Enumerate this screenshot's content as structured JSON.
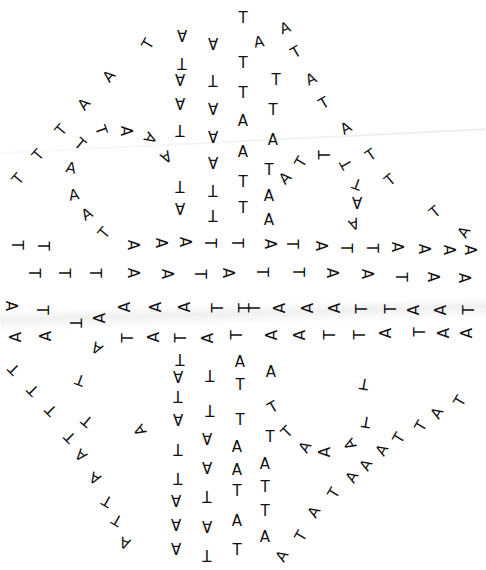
{
  "diagram": {
    "type": "nucleic-acid secondary structure",
    "alphabet": [
      "A",
      "T"
    ],
    "text_color": "#111111",
    "background": "#ffffff",
    "nucleotides": [
      {
        "c": "T",
        "x": 243,
        "y": 18,
        "r": 0
      },
      {
        "c": "A",
        "x": 259,
        "y": 42,
        "r": -10
      },
      {
        "c": "A",
        "x": 285,
        "y": 28,
        "r": -20
      },
      {
        "c": "T",
        "x": 296,
        "y": 52,
        "r": -30
      },
      {
        "c": "A",
        "x": 311,
        "y": 79,
        "r": -25
      },
      {
        "c": "T",
        "x": 324,
        "y": 103,
        "r": -30
      },
      {
        "c": "A",
        "x": 346,
        "y": 128,
        "r": -30
      },
      {
        "c": "T",
        "x": 371,
        "y": 155,
        "r": -35
      },
      {
        "c": "T",
        "x": 390,
        "y": 180,
        "r": -40
      },
      {
        "c": "T",
        "x": 435,
        "y": 212,
        "r": -40
      },
      {
        "c": "A",
        "x": 464,
        "y": 232,
        "r": -60
      },
      {
        "c": "A",
        "x": 182,
        "y": 35,
        "r": 180
      },
      {
        "c": "A",
        "x": 213,
        "y": 43,
        "r": 180
      },
      {
        "c": "T",
        "x": 243,
        "y": 63,
        "r": 0
      },
      {
        "c": "T",
        "x": 276,
        "y": 80,
        "r": 0
      },
      {
        "c": "T",
        "x": 182,
        "y": 63,
        "r": 180
      },
      {
        "c": "T",
        "x": 213,
        "y": 80,
        "r": 180
      },
      {
        "c": "A",
        "x": 180,
        "y": 79,
        "r": 180
      },
      {
        "c": "A",
        "x": 180,
        "y": 103,
        "r": 180
      },
      {
        "c": "A",
        "x": 213,
        "y": 108,
        "r": 180
      },
      {
        "c": "T",
        "x": 243,
        "y": 93,
        "r": 0
      },
      {
        "c": "T",
        "x": 273,
        "y": 110,
        "r": 0
      },
      {
        "c": "A",
        "x": 243,
        "y": 121,
        "r": 0
      },
      {
        "c": "A",
        "x": 213,
        "y": 136,
        "r": 180
      },
      {
        "c": "T",
        "x": 180,
        "y": 130,
        "r": 180
      },
      {
        "c": "A",
        "x": 273,
        "y": 140,
        "r": 0
      },
      {
        "c": "A",
        "x": 243,
        "y": 152,
        "r": 0
      },
      {
        "c": "A",
        "x": 213,
        "y": 162,
        "r": 180
      },
      {
        "c": "T",
        "x": 269,
        "y": 170,
        "r": 0
      },
      {
        "c": "T",
        "x": 243,
        "y": 182,
        "r": 0
      },
      {
        "c": "T",
        "x": 213,
        "y": 190,
        "r": 180
      },
      {
        "c": "A",
        "x": 269,
        "y": 196,
        "r": 0
      },
      {
        "c": "T",
        "x": 243,
        "y": 208,
        "r": 0
      },
      {
        "c": "T",
        "x": 213,
        "y": 215,
        "r": 180
      },
      {
        "c": "A",
        "x": 269,
        "y": 220,
        "r": 0
      },
      {
        "c": "T",
        "x": 180,
        "y": 186,
        "r": 180
      },
      {
        "c": "A",
        "x": 180,
        "y": 208,
        "r": 180
      },
      {
        "c": "A",
        "x": 166,
        "y": 157,
        "r": 150
      },
      {
        "c": "A",
        "x": 150,
        "y": 138,
        "r": 120
      },
      {
        "c": "A",
        "x": 126,
        "y": 131,
        "r": 90
      },
      {
        "c": "T",
        "x": 101,
        "y": 130,
        "r": 70
      },
      {
        "c": "T",
        "x": 80,
        "y": 144,
        "r": 40
      },
      {
        "c": "A",
        "x": 71,
        "y": 168,
        "r": 10
      },
      {
        "c": "A",
        "x": 74,
        "y": 195,
        "r": -10
      },
      {
        "c": "A",
        "x": 87,
        "y": 214,
        "r": -30
      },
      {
        "c": "T",
        "x": 104,
        "y": 233,
        "r": -50
      },
      {
        "c": "T",
        "x": 148,
        "y": 44,
        "r": -60
      },
      {
        "c": "A",
        "x": 109,
        "y": 76,
        "r": -50
      },
      {
        "c": "A",
        "x": 84,
        "y": 104,
        "r": -50
      },
      {
        "c": "T",
        "x": 61,
        "y": 130,
        "r": -50
      },
      {
        "c": "T",
        "x": 38,
        "y": 155,
        "r": -50
      },
      {
        "c": "T",
        "x": 18,
        "y": 179,
        "r": -50
      },
      {
        "c": "A",
        "x": 285,
        "y": 178,
        "r": -45
      },
      {
        "c": "T",
        "x": 301,
        "y": 162,
        "r": -60
      },
      {
        "c": "T",
        "x": 325,
        "y": 155,
        "r": -90
      },
      {
        "c": "T",
        "x": 346,
        "y": 164,
        "r": -120
      },
      {
        "c": "T",
        "x": 357,
        "y": 184,
        "r": -160
      },
      {
        "c": "A",
        "x": 357,
        "y": 202,
        "r": 180
      },
      {
        "c": "A",
        "x": 354,
        "y": 224,
        "r": 160
      },
      {
        "c": "T",
        "x": 17,
        "y": 245,
        "r": 90
      },
      {
        "c": "T",
        "x": 43,
        "y": 246,
        "r": 90
      },
      {
        "c": "A",
        "x": 133,
        "y": 245,
        "r": 90
      },
      {
        "c": "A",
        "x": 161,
        "y": 243,
        "r": 90
      },
      {
        "c": "A",
        "x": 185,
        "y": 242,
        "r": 90
      },
      {
        "c": "T",
        "x": 210,
        "y": 243,
        "r": 90
      },
      {
        "c": "T",
        "x": 237,
        "y": 243,
        "r": 90
      },
      {
        "c": "A",
        "x": 270,
        "y": 244,
        "r": 90
      },
      {
        "c": "T",
        "x": 292,
        "y": 244,
        "r": 90
      },
      {
        "c": "A",
        "x": 321,
        "y": 246,
        "r": 90
      },
      {
        "c": "T",
        "x": 346,
        "y": 248,
        "r": 90
      },
      {
        "c": "T",
        "x": 372,
        "y": 248,
        "r": 90
      },
      {
        "c": "A",
        "x": 397,
        "y": 247,
        "r": 90
      },
      {
        "c": "A",
        "x": 424,
        "y": 249,
        "r": 90
      },
      {
        "c": "A",
        "x": 449,
        "y": 250,
        "r": 90
      },
      {
        "c": "A",
        "x": 470,
        "y": 250,
        "r": 90
      },
      {
        "c": "T",
        "x": 34,
        "y": 273,
        "r": 90
      },
      {
        "c": "T",
        "x": 64,
        "y": 273,
        "r": 90
      },
      {
        "c": "T",
        "x": 95,
        "y": 273,
        "r": 90
      },
      {
        "c": "A",
        "x": 133,
        "y": 273,
        "r": 90
      },
      {
        "c": "A",
        "x": 167,
        "y": 274,
        "r": 90
      },
      {
        "c": "T",
        "x": 200,
        "y": 274,
        "r": 90
      },
      {
        "c": "A",
        "x": 228,
        "y": 273,
        "r": 90
      },
      {
        "c": "T",
        "x": 262,
        "y": 272,
        "r": 90
      },
      {
        "c": "T",
        "x": 298,
        "y": 272,
        "r": 90
      },
      {
        "c": "A",
        "x": 332,
        "y": 273,
        "r": 90
      },
      {
        "c": "A",
        "x": 367,
        "y": 274,
        "r": 90
      },
      {
        "c": "T",
        "x": 401,
        "y": 277,
        "r": 90
      },
      {
        "c": "A",
        "x": 433,
        "y": 277,
        "r": 90
      },
      {
        "c": "A",
        "x": 464,
        "y": 278,
        "r": 90
      },
      {
        "c": "A",
        "x": 11,
        "y": 306,
        "r": 90
      },
      {
        "c": "T",
        "x": 42,
        "y": 310,
        "r": 90
      },
      {
        "c": "T",
        "x": 75,
        "y": 323,
        "r": 90
      },
      {
        "c": "A",
        "x": 100,
        "y": 318,
        "r": -90
      },
      {
        "c": "A",
        "x": 125,
        "y": 307,
        "r": -90
      },
      {
        "c": "A",
        "x": 156,
        "y": 307,
        "r": -90
      },
      {
        "c": "A",
        "x": 185,
        "y": 307,
        "r": -90
      },
      {
        "c": "T",
        "x": 218,
        "y": 308,
        "r": -90
      },
      {
        "c": "T",
        "x": 245,
        "y": 308,
        "r": -90
      },
      {
        "c": "T",
        "x": 255,
        "y": 308,
        "r": -90
      },
      {
        "c": "A",
        "x": 280,
        "y": 308,
        "r": -90
      },
      {
        "c": "A",
        "x": 308,
        "y": 308,
        "r": -90
      },
      {
        "c": "A",
        "x": 335,
        "y": 308,
        "r": -90
      },
      {
        "c": "T",
        "x": 362,
        "y": 309,
        "r": -90
      },
      {
        "c": "T",
        "x": 391,
        "y": 309,
        "r": -90
      },
      {
        "c": "A",
        "x": 414,
        "y": 310,
        "r": -90
      },
      {
        "c": "A",
        "x": 441,
        "y": 310,
        "r": -90
      },
      {
        "c": "T",
        "x": 469,
        "y": 310,
        "r": -90
      },
      {
        "c": "A",
        "x": 16,
        "y": 337,
        "r": -90
      },
      {
        "c": "A",
        "x": 46,
        "y": 336,
        "r": -90
      },
      {
        "c": "T",
        "x": 128,
        "y": 338,
        "r": -90
      },
      {
        "c": "A",
        "x": 154,
        "y": 337,
        "r": -90
      },
      {
        "c": "T",
        "x": 181,
        "y": 338,
        "r": -90
      },
      {
        "c": "A",
        "x": 208,
        "y": 338,
        "r": -90
      },
      {
        "c": "T",
        "x": 237,
        "y": 335,
        "r": -90
      },
      {
        "c": "A",
        "x": 272,
        "y": 335,
        "r": -90
      },
      {
        "c": "A",
        "x": 300,
        "y": 335,
        "r": -90
      },
      {
        "c": "T",
        "x": 330,
        "y": 335,
        "r": -90
      },
      {
        "c": "T",
        "x": 360,
        "y": 335,
        "r": -90
      },
      {
        "c": "A",
        "x": 386,
        "y": 333,
        "r": -90
      },
      {
        "c": "T",
        "x": 420,
        "y": 332,
        "r": -90
      },
      {
        "c": "A",
        "x": 444,
        "y": 333,
        "r": -90
      },
      {
        "c": "A",
        "x": 467,
        "y": 333,
        "r": -90
      },
      {
        "c": "A",
        "x": 97,
        "y": 348,
        "r": -150
      },
      {
        "c": "T",
        "x": 80,
        "y": 380,
        "r": -160
      },
      {
        "c": "T",
        "x": 87,
        "y": 421,
        "r": -140
      },
      {
        "c": "A",
        "x": 140,
        "y": 430,
        "r": -120
      },
      {
        "c": "T",
        "x": 14,
        "y": 369,
        "r": -135
      },
      {
        "c": "T",
        "x": 33,
        "y": 390,
        "r": -135
      },
      {
        "c": "T",
        "x": 51,
        "y": 410,
        "r": -135
      },
      {
        "c": "T",
        "x": 70,
        "y": 437,
        "r": -135
      },
      {
        "c": "A",
        "x": 81,
        "y": 455,
        "r": -140
      },
      {
        "c": "A",
        "x": 95,
        "y": 478,
        "r": -150
      },
      {
        "c": "T",
        "x": 107,
        "y": 501,
        "r": -150
      },
      {
        "c": "T",
        "x": 117,
        "y": 520,
        "r": -150
      },
      {
        "c": "A",
        "x": 125,
        "y": 543,
        "r": -160
      },
      {
        "c": "T",
        "x": 180,
        "y": 359,
        "r": 180
      },
      {
        "c": "A",
        "x": 178,
        "y": 376,
        "r": 180
      },
      {
        "c": "T",
        "x": 178,
        "y": 396,
        "r": 180
      },
      {
        "c": "A",
        "x": 178,
        "y": 419,
        "r": 180
      },
      {
        "c": "T",
        "x": 178,
        "y": 449,
        "r": 180
      },
      {
        "c": "T",
        "x": 178,
        "y": 478,
        "r": 180
      },
      {
        "c": "A",
        "x": 176,
        "y": 500,
        "r": 180
      },
      {
        "c": "A",
        "x": 176,
        "y": 524,
        "r": 180
      },
      {
        "c": "A",
        "x": 176,
        "y": 548,
        "r": 180
      },
      {
        "c": "T",
        "x": 210,
        "y": 375,
        "r": 180
      },
      {
        "c": "T",
        "x": 210,
        "y": 410,
        "r": 180
      },
      {
        "c": "A",
        "x": 207,
        "y": 438,
        "r": 180
      },
      {
        "c": "A",
        "x": 207,
        "y": 467,
        "r": 180
      },
      {
        "c": "T",
        "x": 207,
        "y": 496,
        "r": 180
      },
      {
        "c": "A",
        "x": 207,
        "y": 526,
        "r": 180
      },
      {
        "c": "T",
        "x": 207,
        "y": 555,
        "r": 180
      },
      {
        "c": "A",
        "x": 240,
        "y": 362,
        "r": 0
      },
      {
        "c": "T",
        "x": 240,
        "y": 385,
        "r": 0
      },
      {
        "c": "T",
        "x": 240,
        "y": 420,
        "r": 0
      },
      {
        "c": "A",
        "x": 237,
        "y": 447,
        "r": 0
      },
      {
        "c": "A",
        "x": 237,
        "y": 470,
        "r": 0
      },
      {
        "c": "T",
        "x": 237,
        "y": 491,
        "r": 0
      },
      {
        "c": "A",
        "x": 237,
        "y": 521,
        "r": 0
      },
      {
        "c": "T",
        "x": 237,
        "y": 550,
        "r": 0
      },
      {
        "c": "A",
        "x": 271,
        "y": 372,
        "r": 0
      },
      {
        "c": "T",
        "x": 273,
        "y": 407,
        "r": -30
      },
      {
        "c": "T",
        "x": 270,
        "y": 437,
        "r": 0
      },
      {
        "c": "A",
        "x": 265,
        "y": 464,
        "r": 0
      },
      {
        "c": "T",
        "x": 265,
        "y": 487,
        "r": 0
      },
      {
        "c": "T",
        "x": 265,
        "y": 511,
        "r": 0
      },
      {
        "c": "A",
        "x": 265,
        "y": 537,
        "r": 0
      },
      {
        "c": "T",
        "x": 287,
        "y": 432,
        "r": -45
      },
      {
        "c": "A",
        "x": 305,
        "y": 447,
        "r": -60
      },
      {
        "c": "A",
        "x": 325,
        "y": 452,
        "r": -90
      },
      {
        "c": "A",
        "x": 350,
        "y": 444,
        "r": -120
      },
      {
        "c": "T",
        "x": 366,
        "y": 422,
        "r": -170
      },
      {
        "c": "T",
        "x": 364,
        "y": 384,
        "r": -170
      },
      {
        "c": "T",
        "x": 460,
        "y": 401,
        "r": -60
      },
      {
        "c": "A",
        "x": 437,
        "y": 413,
        "r": -60
      },
      {
        "c": "T",
        "x": 421,
        "y": 426,
        "r": -60
      },
      {
        "c": "T",
        "x": 399,
        "y": 438,
        "r": -60
      },
      {
        "c": "A",
        "x": 382,
        "y": 450,
        "r": -60
      },
      {
        "c": "A",
        "x": 366,
        "y": 465,
        "r": -60
      },
      {
        "c": "A",
        "x": 352,
        "y": 477,
        "r": -60
      },
      {
        "c": "T",
        "x": 334,
        "y": 493,
        "r": -60
      },
      {
        "c": "A",
        "x": 314,
        "y": 512,
        "r": -60
      },
      {
        "c": "T",
        "x": 301,
        "y": 536,
        "r": -60
      },
      {
        "c": "A",
        "x": 282,
        "y": 556,
        "r": -60
      }
    ]
  }
}
